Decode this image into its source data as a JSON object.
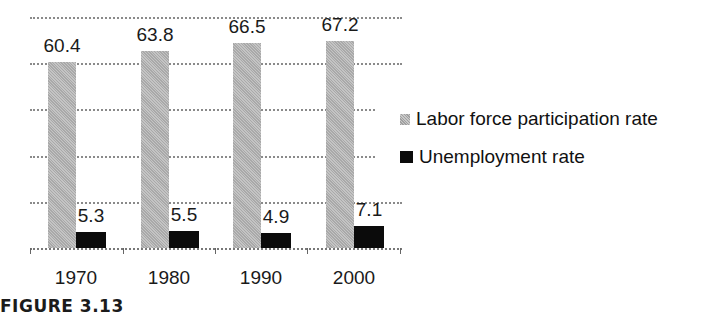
{
  "figure_label": "FIGURE 3.13",
  "chart_data": {
    "type": "bar",
    "title": "",
    "xlabel": "",
    "ylabel": "",
    "categories": [
      "1970",
      "1980",
      "1990",
      "2000"
    ],
    "series": [
      {
        "name": "Labor force participation rate",
        "values": [
          60.4,
          63.8,
          66.5,
          67.2
        ],
        "color": "#b5b5b5",
        "pattern": "stippled-gray"
      },
      {
        "name": "Unemployment rate",
        "values": [
          5.3,
          5.5,
          4.9,
          7.1
        ],
        "color": "#0b0b0b"
      }
    ],
    "data_labels": {
      "labor": [
        "60.4",
        "63.8",
        "66.5",
        "67.2"
      ],
      "unemp": [
        "5.3",
        "5.5",
        "4.9",
        "7.1"
      ]
    },
    "ylim": [
      0,
      75
    ],
    "gridlines": [
      15,
      30,
      45,
      60,
      75
    ],
    "y_tick_labels_visible": false,
    "grid": true,
    "legend_position": "right"
  },
  "legend": {
    "items": [
      {
        "label": "Labor force participation rate"
      },
      {
        "label": "Unemployment rate"
      }
    ]
  }
}
